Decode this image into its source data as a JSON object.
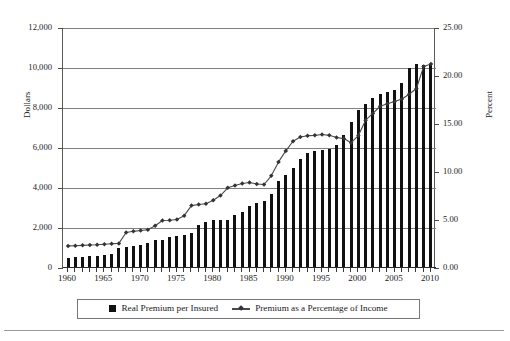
{
  "chart_data": {
    "type": "bar",
    "title": "",
    "subtitle": "",
    "xlabel": "",
    "ylabel": "Dollars",
    "y2label": "Percent",
    "xlim": [
      1959.3,
      2010.7
    ],
    "ylim": [
      0,
      12000
    ],
    "y2lim": [
      0,
      25
    ],
    "grid": true,
    "legend_position": "bottom",
    "x_tick_labels": [
      "1960",
      "1965",
      "1970",
      "1975",
      "1980",
      "1985",
      "1990",
      "1995",
      "2000",
      "2005",
      "2010"
    ],
    "x_tick_values": [
      1960,
      1965,
      1970,
      1975,
      1980,
      1985,
      1990,
      1995,
      2000,
      2005,
      2010
    ],
    "y_tick_labels": [
      "0",
      "2,000",
      "4,000",
      "6,000",
      "8,000",
      "10,000",
      "12,000"
    ],
    "y_tick_values": [
      0,
      2000,
      4000,
      6000,
      8000,
      10000,
      12000
    ],
    "y2_tick_labels": [
      "0.00",
      "5.00",
      "10.00",
      "15.00",
      "20.00",
      "25.00"
    ],
    "y2_tick_values": [
      0,
      5,
      10,
      15,
      20,
      25
    ],
    "x": [
      1960,
      1961,
      1962,
      1963,
      1964,
      1965,
      1966,
      1967,
      1968,
      1969,
      1970,
      1971,
      1972,
      1973,
      1974,
      1975,
      1976,
      1977,
      1978,
      1979,
      1980,
      1981,
      1982,
      1983,
      1984,
      1985,
      1986,
      1987,
      1988,
      1989,
      1990,
      1991,
      1992,
      1993,
      1994,
      1995,
      1996,
      1997,
      1998,
      1999,
      2000,
      2001,
      2002,
      2003,
      2004,
      2005,
      2006,
      2007,
      2008,
      2009,
      2010
    ],
    "series": [
      {
        "name": "Real Premium per Insured",
        "type": "bar",
        "axis": "left",
        "unit": "dollars",
        "color": "#111111",
        "values": [
          520,
          550,
          570,
          590,
          610,
          650,
          720,
          980,
          1050,
          1120,
          1160,
          1250,
          1380,
          1420,
          1540,
          1600,
          1670,
          1760,
          2150,
          2280,
          2390,
          2400,
          2400,
          2660,
          2820,
          3100,
          3260,
          3350,
          3690,
          4330,
          4670,
          5000,
          5470,
          5770,
          5870,
          5900,
          5960,
          6140,
          6650,
          7300,
          7890,
          8220,
          8480,
          8700,
          8800,
          8920,
          9240,
          10000,
          10200,
          10150,
          10200
        ]
      },
      {
        "name": "Premium as a Percentage of Income",
        "type": "line",
        "axis": "right",
        "unit": "percent",
        "color": "#4a4a4a",
        "marker": "diamond",
        "values": [
          2.3,
          2.32,
          2.36,
          2.4,
          2.42,
          2.48,
          2.52,
          2.56,
          3.7,
          3.82,
          3.9,
          3.98,
          4.4,
          4.95,
          4.98,
          5.05,
          5.45,
          6.5,
          6.62,
          6.7,
          7.05,
          7.55,
          8.35,
          8.6,
          8.8,
          8.9,
          8.75,
          8.7,
          9.6,
          11.05,
          12.2,
          13.2,
          13.65,
          13.78,
          13.82,
          13.9,
          13.82,
          13.6,
          13.48,
          13.05,
          13.8,
          15.4,
          16.1,
          16.85,
          17.1,
          17.35,
          17.6,
          18.1,
          18.7,
          21.0,
          21.25
        ]
      }
    ]
  },
  "axis_titles": {
    "left": "Dollars",
    "right": "Percent"
  },
  "legend": {
    "items": [
      {
        "label": "Real Premium per Insured",
        "marker": "square-swatch"
      },
      {
        "label": "Premium as a Percentage of Income",
        "marker": "line-diamond-swatch"
      }
    ]
  },
  "colors": {
    "bar": "#111111",
    "line": "#4a4a4a",
    "grid": "#808080",
    "axis": "#5a5a5a",
    "text": "#1a1a1a",
    "background": "#ffffff"
  }
}
